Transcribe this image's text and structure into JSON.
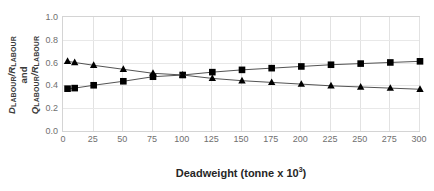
{
  "chart_data": {
    "type": "line",
    "title": "",
    "subtitle": "",
    "xlabel_text": "Deadweight (tonne x 10",
    "xlabel_sup": "3",
    "xlabel_close": ")",
    "xlabel": "Deadweight (tonne x 10^3)",
    "ylabel": "D_LABOUR/R_LABOUR and Q_LABOUR/R_LABOUR",
    "ylabel_parts": {
      "d": "D",
      "sub_labour_1": "LABOUR",
      "slash_1": "/",
      "r1": "R",
      "sub_labour_2": "LABOUR",
      "and": "and",
      "q": "Q",
      "sub_labour_3": "LABOUR",
      "slash_2": "/",
      "r2": "R",
      "sub_labour_4": "LABOUR"
    },
    "xlim": [
      0,
      300
    ],
    "ylim": [
      0.0,
      1.0
    ],
    "xticks": [
      0,
      25,
      50,
      75,
      100,
      125,
      150,
      175,
      200,
      225,
      250,
      275,
      300
    ],
    "xticklabels": [
      "0",
      "25",
      "50",
      "75",
      "100",
      "125",
      "150",
      "175",
      "200",
      "225",
      "250",
      "275",
      "300"
    ],
    "yticks": [
      0.0,
      0.2,
      0.4,
      0.6,
      0.8,
      1.0
    ],
    "yticklabels": [
      "0.0",
      "0.2",
      "0.4",
      "0.6",
      "0.8",
      "1.0"
    ],
    "grid": true,
    "grid_color": "#e2e2e2",
    "legend": false,
    "legend_position": "none",
    "background": "#ffffff",
    "line_color": "#3f3f3f",
    "marker_color": "#000000",
    "series": [
      {
        "name": "Q_LABOUR/R_LABOUR",
        "marker": "square",
        "color": "#000000",
        "x": [
          3,
          9,
          25,
          50,
          75,
          100,
          125,
          150,
          175,
          200,
          225,
          250,
          275,
          300
        ],
        "values": [
          0.38,
          0.385,
          0.41,
          0.445,
          0.485,
          0.5,
          0.525,
          0.545,
          0.56,
          0.575,
          0.59,
          0.6,
          0.61,
          0.62
        ]
      },
      {
        "name": "D_LABOUR/R_LABOUR",
        "marker": "triangle",
        "color": "#000000",
        "x": [
          3,
          9,
          25,
          50,
          75,
          100,
          125,
          150,
          175,
          200,
          225,
          250,
          275,
          300
        ],
        "values": [
          0.62,
          0.61,
          0.585,
          0.55,
          0.515,
          0.5,
          0.47,
          0.45,
          0.435,
          0.42,
          0.405,
          0.395,
          0.385,
          0.375
        ]
      }
    ]
  }
}
